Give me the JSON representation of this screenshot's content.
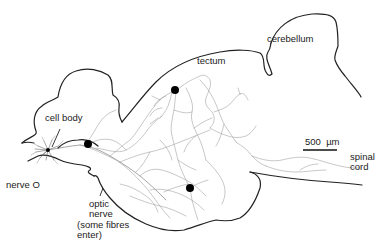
{
  "figure": {
    "type": "neuron-tracing-diagram",
    "labels": {
      "cerebellum": "cerebellum",
      "tectum": "tectum",
      "cell_body": "cell body",
      "nerve_o": "nerve O",
      "optic_nerve": "optic\nnerve",
      "optic_nerve_note": "(some fibres\nenter)",
      "spinal_cord": "spinal\ncord",
      "scale_bar": "500  µm"
    },
    "colors": {
      "outline": "#222222",
      "fibres": "#9a9a9a",
      "markers": "#000000",
      "background": "#ffffff"
    },
    "markers": [
      {
        "name": "marker-forebrain",
        "x": 88,
        "y": 144
      },
      {
        "name": "marker-tectum-upper",
        "x": 175,
        "y": 90
      },
      {
        "name": "marker-tectum-lower",
        "x": 190,
        "y": 188
      }
    ]
  }
}
